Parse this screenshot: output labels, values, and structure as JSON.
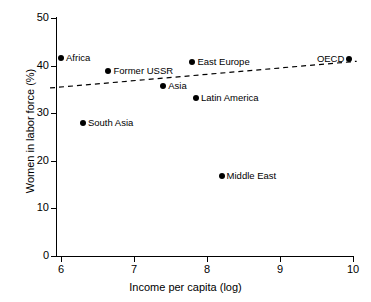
{
  "chart_data": {
    "type": "scatter",
    "title": "",
    "xlabel": "Income per capita (log)",
    "ylabel": "Women in labor force (%)",
    "xlim": [
      5.8,
      10.2
    ],
    "ylim": [
      0,
      50
    ],
    "xticks": [
      6,
      7,
      8,
      9,
      10
    ],
    "yticks": [
      0,
      10,
      20,
      30,
      40,
      50
    ],
    "xtick_labels": [
      "6",
      "7",
      "8",
      "9",
      "10"
    ],
    "ytick_labels": [
      "0",
      "10",
      "20",
      "30",
      "40",
      "50"
    ],
    "grid": false,
    "legend": false,
    "points": [
      {
        "label": "Africa",
        "x": 6.0,
        "y": 41.5,
        "label_side": "right"
      },
      {
        "label": "Former USSR",
        "x": 6.65,
        "y": 38.8,
        "label_side": "right"
      },
      {
        "label": "South Asia",
        "x": 6.3,
        "y": 28.0,
        "label_side": "right"
      },
      {
        "label": "Asia",
        "x": 7.4,
        "y": 35.8,
        "label_side": "right"
      },
      {
        "label": "East Europe",
        "x": 7.8,
        "y": 40.7,
        "label_side": "right"
      },
      {
        "label": "Latin America",
        "x": 7.85,
        "y": 33.2,
        "label_side": "right"
      },
      {
        "label": "Middle East",
        "x": 8.2,
        "y": 16.9,
        "label_side": "right"
      },
      {
        "label": "OECD",
        "x": 9.95,
        "y": 41.4,
        "label_side": "left"
      }
    ],
    "trend_line": {
      "style": "dashed",
      "x_start": 5.85,
      "y_start": 35.3,
      "x_end": 10.05,
      "y_end": 40.9
    },
    "colors": {
      "marker": "#000000",
      "axis": "#000000",
      "trend": "#000000",
      "background": "#ffffff"
    }
  }
}
